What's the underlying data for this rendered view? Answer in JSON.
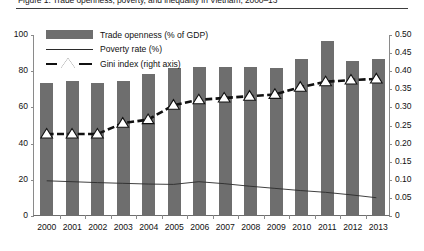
{
  "caption": {
    "text": "Figure 1. Trade openness, poverty, and inequality in Vietnam, 2000–13"
  },
  "chart_data": {
    "type": "bar",
    "title": "",
    "xlabel": "",
    "ylabel": "",
    "categories": [
      "2000",
      "2001",
      "2002",
      "2003",
      "2004",
      "2005",
      "2006",
      "2007",
      "2008",
      "2009",
      "2010",
      "2011",
      "2012",
      "2013"
    ],
    "ylim": [
      0,
      100
    ],
    "yticks": [
      "0",
      "20",
      "40",
      "60",
      "80",
      "100"
    ],
    "y2lim": [
      0,
      0.5
    ],
    "y2ticks": [
      "0",
      "0.05",
      "0.10",
      "0.15",
      "0.20",
      "0.25",
      "0.30",
      "0.35",
      "0.40",
      "0.45",
      "0.50"
    ],
    "grid": false,
    "legend_position": "top-left",
    "series": [
      {
        "name": "Trade openness (% of GDP)",
        "type": "bar",
        "axis": "left",
        "color": "#6e6e6e",
        "values": [
          73,
          74,
          73,
          74,
          78,
          81,
          82,
          82,
          82,
          81,
          86,
          96,
          85,
          86
        ]
      },
      {
        "name": "Poverty rate (%)",
        "type": "line",
        "axis": "left",
        "color": "#2b2b2b",
        "values": [
          19.0,
          18.5,
          18.0,
          17.6,
          17.2,
          17.0,
          18.5,
          17.4,
          16.0,
          14.8,
          13.6,
          12.6,
          11.2,
          9.6
        ]
      },
      {
        "name": "Gini index (right axis)",
        "type": "line",
        "axis": "right",
        "color": "#111111",
        "marker": "triangle",
        "values": [
          0.225,
          0.225,
          0.225,
          0.255,
          0.265,
          0.305,
          0.32,
          0.325,
          0.33,
          0.335,
          0.355,
          0.37,
          0.375,
          0.378
        ]
      }
    ]
  }
}
